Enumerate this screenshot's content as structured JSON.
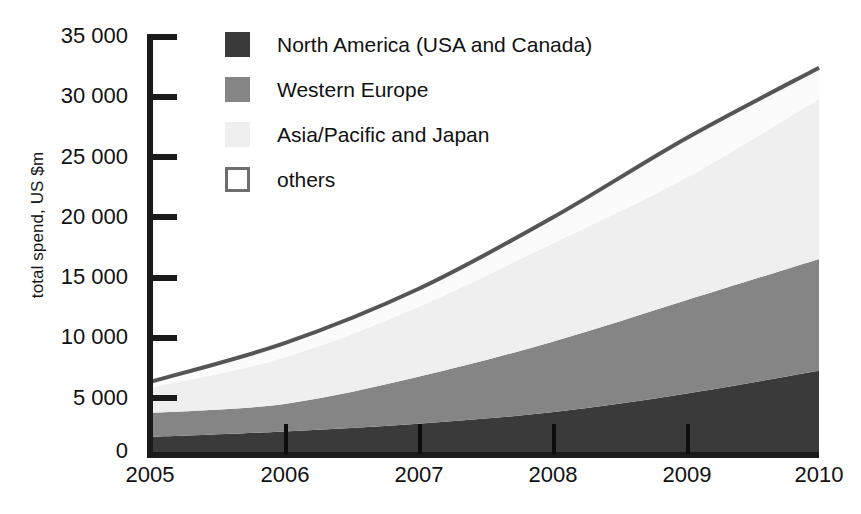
{
  "chart_data": {
    "type": "area",
    "stacked": true,
    "title": "",
    "subtitle": "",
    "xlabel": "",
    "ylabel": "total spend, US $m",
    "x": [
      "2005",
      "2006",
      "2007",
      "2008",
      "2009",
      "2010"
    ],
    "categories": [
      "2005",
      "2006",
      "2007",
      "2008",
      "2009",
      "2010"
    ],
    "xtick_labels": [
      "2005",
      "2006",
      "2007",
      "2008",
      "2009",
      "2010"
    ],
    "ytick_labels": [
      "0",
      "5 000",
      "10 000",
      "15 000",
      "20 000",
      "25 000",
      "30 000",
      "35 000"
    ],
    "ytick_values": [
      0,
      5000,
      10000,
      15000,
      20000,
      25000,
      30000,
      35000
    ],
    "ylim": [
      0,
      35000
    ],
    "grid": false,
    "legend_position": "upper-left-inside",
    "series": [
      {
        "name": "North America (USA and Canada)",
        "color": "#3a3a3a",
        "values": [
          1500,
          1950,
          2600,
          3550,
          5100,
          7000
        ]
      },
      {
        "name": "Western Europe",
        "color": "#858585",
        "values": [
          2000,
          2300,
          3900,
          5850,
          7750,
          9300
        ]
      },
      {
        "name": "Asia/Pacific and Japan",
        "color": "#efefef",
        "values": [
          2100,
          3850,
          5800,
          8150,
          10150,
          13300
        ]
      },
      {
        "name": "others",
        "color": "#fbfbfb",
        "values": [
          500,
          1200,
          1500,
          2150,
          3300,
          2600
        ]
      }
    ],
    "cumulative_totals": [
      6100,
      9300,
      13800,
      19700,
      26300,
      32200
    ],
    "line_color": "#555555"
  },
  "legend": {
    "items": [
      {
        "label": "North America (USA and Canada)",
        "swatch_name": "legend-swatch-north-america",
        "color": "#3a3a3a",
        "border": "none"
      },
      {
        "label": "Western Europe",
        "swatch_name": "legend-swatch-western-europe",
        "color": "#858585",
        "border": "none"
      },
      {
        "label": "Asia/Pacific and Japan",
        "swatch_name": "legend-swatch-asia-pacific-japan",
        "color": "#efefef",
        "border": "none"
      },
      {
        "label": "others",
        "swatch_name": "legend-swatch-others",
        "color": "#ffffff",
        "border": "3px solid #6e6e6e"
      }
    ]
  },
  "axes": {
    "y_title": "total spend, US $m",
    "y_ticks": [
      "35 000",
      "30 000",
      "25 000",
      "20 000",
      "15 000",
      "10 000",
      "5 000",
      "0"
    ],
    "x_ticks": [
      "2005",
      "2006",
      "2007",
      "2008",
      "2009",
      "2010"
    ]
  },
  "colors": {
    "axis": "#1a1a1a",
    "text": "#111111",
    "north_america": "#3a3a3a",
    "western_europe": "#858585",
    "asia_pacific_japan": "#efefef",
    "others": "#fbfbfb",
    "outline": "#555555",
    "background": "#ffffff"
  }
}
